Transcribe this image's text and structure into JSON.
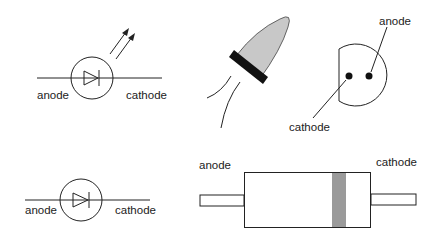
{
  "diagram": {
    "led_symbol": {
      "anode_label": "anode",
      "cathode_label": "cathode"
    },
    "led_bottom_view": {
      "anode_label": "anode",
      "cathode_label": "cathode"
    },
    "diode_symbol": {
      "anode_label": "anode",
      "cathode_label": "cathode"
    },
    "axial_diode": {
      "anode_label": "anode",
      "cathode_label": "cathode"
    },
    "colors": {
      "line": "#222222",
      "led_body": "#c8c8c8",
      "band": "#111111",
      "cathode_band": "#9a9a9a"
    }
  }
}
